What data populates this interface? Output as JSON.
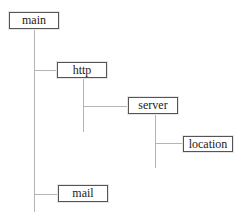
{
  "diagram": {
    "type": "tree",
    "colors": {
      "line": "#b4b4b4",
      "box_border": "#555555",
      "text": "#222222",
      "background": "#ffffff"
    },
    "nodes": [
      {
        "id": "main",
        "label": "main",
        "parent": null
      },
      {
        "id": "http",
        "label": "http",
        "parent": "main"
      },
      {
        "id": "server",
        "label": "server",
        "parent": "http"
      },
      {
        "id": "location",
        "label": "location",
        "parent": "server"
      },
      {
        "id": "mail",
        "label": "mail",
        "parent": "main"
      }
    ]
  }
}
